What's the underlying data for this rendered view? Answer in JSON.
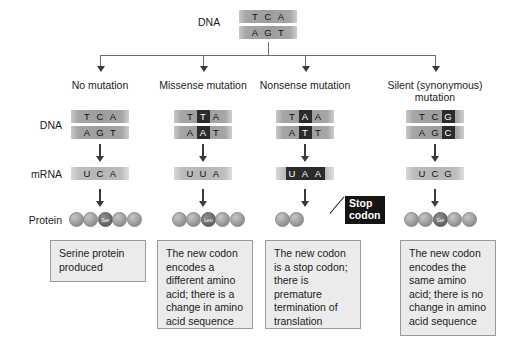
{
  "diagram": {
    "row_labels": {
      "dna": "DNA",
      "mrna": "mRNA",
      "protein": "Protein"
    },
    "source": {
      "label": "DNA",
      "top_strand": [
        "T",
        "C",
        "A"
      ],
      "bottom_strand": [
        "A",
        "G",
        "T"
      ]
    },
    "stop_callout": {
      "line1": "Stop",
      "line2": "codon"
    },
    "columns": [
      {
        "heading_line1": "No mutation",
        "heading_line2": "",
        "dna_top": [
          "T",
          "C",
          "A"
        ],
        "dna_bottom": [
          "A",
          "G",
          "T"
        ],
        "dna_highlight_index": -1,
        "mrna": [
          "U",
          "C",
          "A"
        ],
        "mrna_all_highlight": false,
        "bead_count": 5,
        "bead_dark_index": 2,
        "amino_acid": "Ser",
        "description": "Serine protein produced"
      },
      {
        "heading_line1": "Missense mutation",
        "heading_line2": "",
        "dna_top": [
          "T",
          "T",
          "A"
        ],
        "dna_bottom": [
          "A",
          "A",
          "T"
        ],
        "dna_highlight_index": 1,
        "mrna": [
          "U",
          "U",
          "A"
        ],
        "mrna_all_highlight": false,
        "bead_count": 5,
        "bead_dark_index": 2,
        "amino_acid": "Leu",
        "description": "The new codon encodes a different amino acid; there is a change in amino acid sequence"
      },
      {
        "heading_line1": "Nonsense mutation",
        "heading_line2": "",
        "dna_top": [
          "T",
          "A",
          "A"
        ],
        "dna_bottom": [
          "A",
          "T",
          "T"
        ],
        "dna_highlight_index": 1,
        "mrna": [
          "U",
          "A",
          "A"
        ],
        "mrna_all_highlight": true,
        "bead_count": 2,
        "bead_dark_index": -1,
        "amino_acid": "",
        "description": "The new codon is a stop codon; there is premature termination of translation"
      },
      {
        "heading_line1": "Silent (synonymous)",
        "heading_line2": "mutation",
        "dna_top": [
          "T",
          "C",
          "G"
        ],
        "dna_bottom": [
          "A",
          "G",
          "C"
        ],
        "dna_highlight_index": 2,
        "mrna": [
          "U",
          "C",
          "G"
        ],
        "mrna_all_highlight": false,
        "bead_count": 5,
        "bead_dark_index": 2,
        "amino_acid": "Ser",
        "description": "The new codon encodes the same amino acid; there is no change in amino acid sequence"
      }
    ],
    "colors": {
      "strand_gray": "#a6a6a6",
      "highlight_dark": "#2b2b2b",
      "box_fill": "#ebebeb",
      "box_border": "#9a9a9a",
      "stop_box": "#141414"
    }
  }
}
